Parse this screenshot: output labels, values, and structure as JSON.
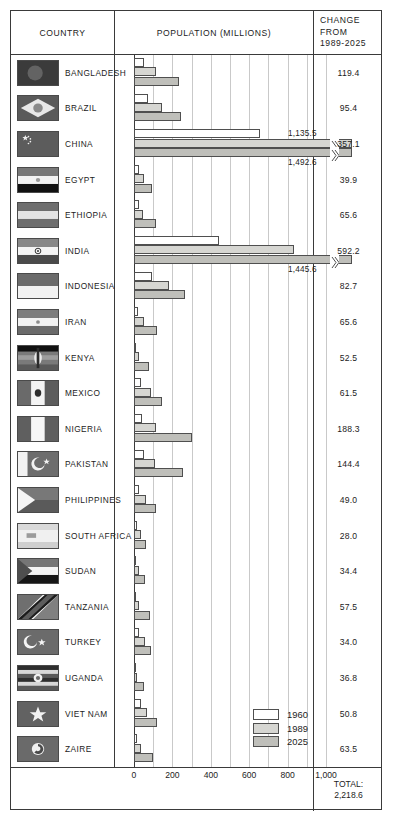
{
  "header": {
    "country": "COUNTRY",
    "population": "POPULATION (MILLIONS)",
    "change_l1": "CHANGE",
    "change_l2": "FROM",
    "change_l3": "1989-2025"
  },
  "legend": {
    "items": [
      {
        "label": "1960",
        "color": "#ffffff",
        "swatch": "legend-swatch-1960"
      },
      {
        "label": "1989",
        "color": "#d6d6d2",
        "swatch": "legend-swatch-1989"
      },
      {
        "label": "2025",
        "color": "#bfbfba",
        "swatch": "legend-swatch-2025"
      }
    ]
  },
  "footer": {
    "total_label": "TOTAL:",
    "total_value": "2,218.6"
  },
  "axis": {
    "ticks": [
      "0",
      "200",
      "400",
      "600",
      "800",
      "1,000"
    ],
    "tick_values": [
      0,
      200,
      400,
      600,
      800,
      1000
    ],
    "max": 1000,
    "gridline_step": 100
  },
  "chart_data": {
    "type": "bar",
    "title": "POPULATION (MILLIONS)",
    "xlabel": "POPULATION (MILLIONS)",
    "ylabel": "COUNTRY",
    "orientation": "horizontal",
    "grid": true,
    "legend_position": "inside-bottom-right",
    "xlim": [
      0,
      1000
    ],
    "categories": [
      "BANGLADESH",
      "BRAZIL",
      "CHINA",
      "EGYPT",
      "ETHIOPIA",
      "INDIA",
      "INDONESIA",
      "IRAN",
      "KENYA",
      "MEXICO",
      "NIGERIA",
      "PAKISTAN",
      "PHILIPPINES",
      "SOUTH AFRICA",
      "SUDAN",
      "TANZANIA",
      "TURKEY",
      "UGANDA",
      "VIET NAM",
      "ZAIRE"
    ],
    "series": [
      {
        "name": "1960",
        "color": "#ffffff",
        "values": [
          51.4,
          72.6,
          657.5,
          25.9,
          24.2,
          442.3,
          96.2,
          21.6,
          8.1,
          36.5,
          42.3,
          49.9,
          27.9,
          17.4,
          11.2,
          10.0,
          27.5,
          7.3,
          34.7,
          15.9
        ]
      },
      {
        "name": "1989",
        "color": "#d6d6d2",
        "values": [
          114.7,
          147.4,
          1135.5,
          51.7,
          48.9,
          835.0,
          184.6,
          54.3,
          24.0,
          86.7,
          113.7,
          110.4,
          64.9,
          35.1,
          24.5,
          24.8,
          55.4,
          17.2,
          66.8,
          34.9
        ]
      },
      {
        "name": "2025",
        "color": "#bfbfba",
        "values": [
          234.1,
          242.8,
          1492.6,
          91.6,
          114.5,
          1445.6,
          267.3,
          119.9,
          76.5,
          148.2,
          302.0,
          254.8,
          113.9,
          63.1,
          58.9,
          82.3,
          89.4,
          54.0,
          117.6,
          98.4
        ]
      }
    ],
    "annotations": [
      {
        "country": "CHINA",
        "series": "1989",
        "text": "1,135.5"
      },
      {
        "country": "CHINA",
        "series": "2025",
        "text": "1,492.6"
      },
      {
        "country": "INDIA",
        "series": "2025",
        "text": "1,445.6"
      }
    ]
  },
  "rows": [
    {
      "country": "BANGLADESH",
      "change": "119.4",
      "flag": "flag-bangladesh"
    },
    {
      "country": "BRAZIL",
      "change": "95.4",
      "flag": "flag-brazil"
    },
    {
      "country": "CHINA",
      "change": "357.1",
      "flag": "flag-china"
    },
    {
      "country": "EGYPT",
      "change": "39.9",
      "flag": "flag-egypt"
    },
    {
      "country": "ETHIOPIA",
      "change": "65.6",
      "flag": "flag-ethiopia"
    },
    {
      "country": "INDIA",
      "change": "592.2",
      "flag": "flag-india"
    },
    {
      "country": "INDONESIA",
      "change": "82.7",
      "flag": "flag-indonesia"
    },
    {
      "country": "IRAN",
      "change": "65.6",
      "flag": "flag-iran"
    },
    {
      "country": "KENYA",
      "change": "52.5",
      "flag": "flag-kenya"
    },
    {
      "country": "MEXICO",
      "change": "61.5",
      "flag": "flag-mexico"
    },
    {
      "country": "NIGERIA",
      "change": "188.3",
      "flag": "flag-nigeria"
    },
    {
      "country": "PAKISTAN",
      "change": "144.4",
      "flag": "flag-pakistan"
    },
    {
      "country": "PHILIPPINES",
      "change": "49.0",
      "flag": "flag-philippines"
    },
    {
      "country": "SOUTH AFRICA",
      "change": "28.0",
      "flag": "flag-south-africa"
    },
    {
      "country": "SUDAN",
      "change": "34.4",
      "flag": "flag-sudan"
    },
    {
      "country": "TANZANIA",
      "change": "57.5",
      "flag": "flag-tanzania"
    },
    {
      "country": "TURKEY",
      "change": "34.0",
      "flag": "flag-turkey"
    },
    {
      "country": "UGANDA",
      "change": "36.8",
      "flag": "flag-uganda"
    },
    {
      "country": "VIET NAM",
      "change": "50.8",
      "flag": "flag-viet-nam"
    },
    {
      "country": "ZAIRE",
      "change": "63.5",
      "flag": "flag-zaire"
    }
  ]
}
